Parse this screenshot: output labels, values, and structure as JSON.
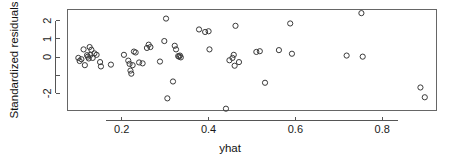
{
  "chart_data": {
    "type": "scatter",
    "title": "",
    "xlabel": "yhat",
    "ylabel": "Standardized residuals",
    "xlim": [
      0.075,
      0.925
    ],
    "ylim": [
      -2.95,
      2.62
    ],
    "grid": false,
    "legend": null,
    "marker": "open-circle",
    "xticks": [
      0.2,
      0.4,
      0.6,
      0.8
    ],
    "xtick_labels": [
      "0.2",
      "0.4",
      "0.6",
      "0.8"
    ],
    "yticks": [
      -2,
      -1,
      0,
      1,
      2
    ],
    "ytick_labels": [
      "-2",
      "",
      "0",
      "1",
      "2"
    ],
    "points": [
      {
        "x": 0.1,
        "y": -0.05
      },
      {
        "x": 0.103,
        "y": -0.22
      },
      {
        "x": 0.107,
        "y": -0.12
      },
      {
        "x": 0.112,
        "y": 0.42
      },
      {
        "x": 0.115,
        "y": -0.45
      },
      {
        "x": 0.12,
        "y": 0.1
      },
      {
        "x": 0.122,
        "y": 0.02
      },
      {
        "x": 0.124,
        "y": -0.08
      },
      {
        "x": 0.126,
        "y": 0.55
      },
      {
        "x": 0.128,
        "y": 0.12
      },
      {
        "x": 0.13,
        "y": 0.4
      },
      {
        "x": 0.133,
        "y": -0.05
      },
      {
        "x": 0.137,
        "y": 0.2
      },
      {
        "x": 0.142,
        "y": 0.12
      },
      {
        "x": 0.15,
        "y": -0.28
      },
      {
        "x": 0.152,
        "y": -0.52
      },
      {
        "x": 0.175,
        "y": -0.42
      },
      {
        "x": 0.205,
        "y": 0.12
      },
      {
        "x": 0.215,
        "y": -0.2
      },
      {
        "x": 0.218,
        "y": -0.38
      },
      {
        "x": 0.22,
        "y": -0.75
      },
      {
        "x": 0.222,
        "y": -0.92
      },
      {
        "x": 0.225,
        "y": -0.45
      },
      {
        "x": 0.228,
        "y": 0.3
      },
      {
        "x": 0.232,
        "y": 0.25
      },
      {
        "x": 0.24,
        "y": -0.3
      },
      {
        "x": 0.248,
        "y": -0.35
      },
      {
        "x": 0.258,
        "y": 0.5
      },
      {
        "x": 0.262,
        "y": 0.68
      },
      {
        "x": 0.266,
        "y": 0.55
      },
      {
        "x": 0.288,
        "y": -0.25
      },
      {
        "x": 0.298,
        "y": 0.88
      },
      {
        "x": 0.302,
        "y": 2.12
      },
      {
        "x": 0.305,
        "y": -2.28
      },
      {
        "x": 0.318,
        "y": -1.35
      },
      {
        "x": 0.322,
        "y": 0.62
      },
      {
        "x": 0.325,
        "y": 0.42
      },
      {
        "x": 0.33,
        "y": 0.05
      },
      {
        "x": 0.332,
        "y": 0.02
      },
      {
        "x": 0.334,
        "y": 0.08
      },
      {
        "x": 0.336,
        "y": -0.02
      },
      {
        "x": 0.378,
        "y": 1.52
      },
      {
        "x": 0.392,
        "y": 1.38
      },
      {
        "x": 0.4,
        "y": 1.42
      },
      {
        "x": 0.402,
        "y": 0.42
      },
      {
        "x": 0.44,
        "y": -2.85
      },
      {
        "x": 0.448,
        "y": -0.18
      },
      {
        "x": 0.455,
        "y": -0.05
      },
      {
        "x": 0.458,
        "y": 0.12
      },
      {
        "x": 0.46,
        "y": -0.48
      },
      {
        "x": 0.462,
        "y": 1.72
      },
      {
        "x": 0.47,
        "y": -0.28
      },
      {
        "x": 0.51,
        "y": 0.28
      },
      {
        "x": 0.518,
        "y": 0.32
      },
      {
        "x": 0.53,
        "y": -1.42
      },
      {
        "x": 0.562,
        "y": 0.38
      },
      {
        "x": 0.588,
        "y": 1.85
      },
      {
        "x": 0.592,
        "y": 0.18
      },
      {
        "x": 0.718,
        "y": 0.08
      },
      {
        "x": 0.752,
        "y": 2.42
      },
      {
        "x": 0.755,
        "y": 0.02
      },
      {
        "x": 0.888,
        "y": -1.68
      },
      {
        "x": 0.898,
        "y": -2.22
      }
    ]
  },
  "colors": {
    "point_stroke": "#3a3a3a",
    "frame": "#666666",
    "axis": "#555555",
    "text": "#111111",
    "background": "#ffffff"
  }
}
